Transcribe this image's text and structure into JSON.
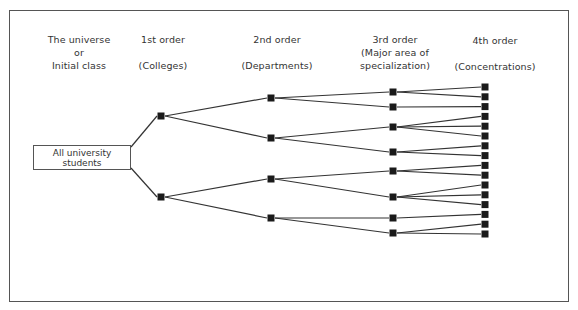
{
  "headers": [
    {
      "id": "universe",
      "lines": [
        "The universe",
        "or",
        "Initial class"
      ]
    },
    {
      "id": "first",
      "lines": [
        "1st order",
        "",
        "(Colleges)"
      ]
    },
    {
      "id": "second",
      "lines": [
        "2nd order",
        "",
        "(Departments)"
      ]
    },
    {
      "id": "third",
      "lines": [
        "3rd order",
        "(Major area of",
        "specialization)"
      ]
    },
    {
      "id": "fourth",
      "lines": [
        "4th order",
        "",
        "(Concentrations)"
      ]
    }
  ],
  "root": {
    "lines": [
      "All university",
      "students"
    ]
  },
  "tree": {
    "levels": [
      "Initial class",
      "Colleges",
      "Departments",
      "Major area of specialization",
      "Concentrations"
    ],
    "first_order_children": [
      2,
      2
    ],
    "second_order_children": [
      2,
      2,
      2,
      2
    ],
    "third_order_children": [
      2,
      1,
      3,
      2,
      2,
      3,
      1,
      2
    ],
    "counts": {
      "first": 2,
      "second": 4,
      "third": 8,
      "fourth": 16
    }
  }
}
